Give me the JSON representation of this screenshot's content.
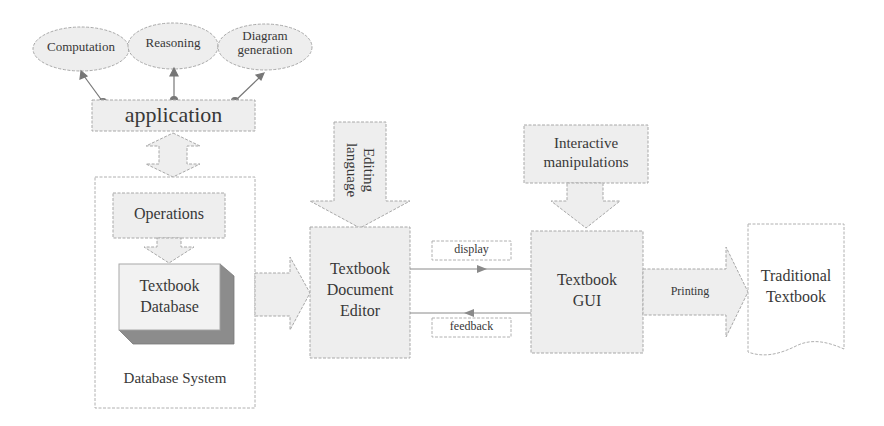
{
  "colors": {
    "fill": "#eeeeee",
    "stroke": "#a8a8a8",
    "shadow": "#8c8c8c",
    "text": "#383838",
    "connector": "#777777"
  },
  "ellipses": [
    {
      "label": "Computation"
    },
    {
      "label": "Reasoning"
    },
    {
      "label": "Diagram generation",
      "line1": "Diagram",
      "line2": "generation"
    }
  ],
  "application": {
    "label": "application"
  },
  "database_system": {
    "label": "Database System",
    "operations": "Operations",
    "database": {
      "line1": "Textbook",
      "line2": "Database"
    }
  },
  "editing_language": {
    "line1": "Editing",
    "line2": "language"
  },
  "editor": {
    "line1": "Textbook",
    "line2": "Document",
    "line3": "Editor"
  },
  "display": {
    "label": "display"
  },
  "feedback": {
    "label": "feedback"
  },
  "interactive": {
    "line1": "Interactive",
    "line2": "manipulations"
  },
  "gui": {
    "line1": "Textbook",
    "line2": "GUI"
  },
  "printing": {
    "label": "Printing"
  },
  "traditional": {
    "line1": "Traditional",
    "line2": "Textbook"
  }
}
